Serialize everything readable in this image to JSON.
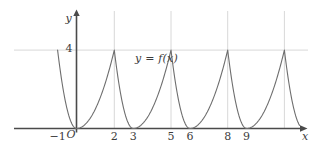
{
  "chart_data": {
    "type": "line",
    "title": "",
    "xlabel": "x",
    "ylabel": "y",
    "annotation": "y = f(x)",
    "origin_label": "O",
    "grid": true,
    "legend": "none",
    "xlim": [
      -1.6,
      12.2
    ],
    "ylim": [
      -0.9,
      5.3
    ],
    "x_ticks": [
      -1,
      2,
      3,
      5,
      6,
      8,
      9
    ],
    "x_tick_labels": [
      "−1",
      "2",
      "3",
      "5",
      "6",
      "8",
      "9"
    ],
    "y_ticks": [
      4
    ],
    "y_tick_labels": [
      "4"
    ],
    "gridlines_vertical": [
      2,
      5,
      8,
      11
    ],
    "gridlines_horizontal": [
      4
    ],
    "period": 3,
    "peak_value": 4,
    "roots": [
      -1,
      0,
      3,
      6,
      9,
      12
    ],
    "peaks_x": [
      -0.333,
      2,
      5,
      8,
      11
    ],
    "series": [
      {
        "name": "f(x)",
        "description": "piecewise periodic parabolas, period 3, rising branch y=(x-3k)^2 on [3k,3k+2] and falling branch y=4(x-3k-3)^2 on [3k+2,3k+3]",
        "x": [
          -1,
          -0.8,
          -0.6,
          -0.4,
          -0.333,
          0,
          0.5,
          1,
          1.5,
          2,
          2.25,
          2.5,
          2.75,
          3,
          3.5,
          4,
          4.5,
          5,
          5.25,
          5.5,
          5.75,
          6,
          6.5,
          7,
          7.5,
          8,
          8.25,
          8.5,
          8.75,
          9,
          9.5,
          10,
          10.5,
          11,
          11.25,
          11.5,
          11.75,
          12
        ],
        "y": [
          0,
          1.44,
          2.56,
          3.24,
          4,
          0,
          0.25,
          1,
          2.25,
          4,
          2.25,
          1,
          0.25,
          0,
          0.25,
          1,
          2.25,
          4,
          2.25,
          1,
          0.25,
          0,
          0.25,
          1,
          2.25,
          4,
          2.25,
          1,
          0.25,
          0,
          0.25,
          1,
          2.25,
          4,
          2.25,
          1,
          0.25,
          0
        ]
      }
    ]
  },
  "colors": {
    "curve": "#6e6e6e",
    "axis": "#4a4a4a",
    "grid": "#d8d8d8",
    "text": "#3c3c3c",
    "background": "#ffffff"
  },
  "labels": {
    "x_axis": "x",
    "y_axis": "y",
    "origin": "O",
    "function": "y = f(x)",
    "tick_neg1": "−1",
    "tick_2": "2",
    "tick_3": "3",
    "tick_5": "5",
    "tick_6": "6",
    "tick_8": "8",
    "tick_9": "9",
    "tick_y4": "4"
  }
}
